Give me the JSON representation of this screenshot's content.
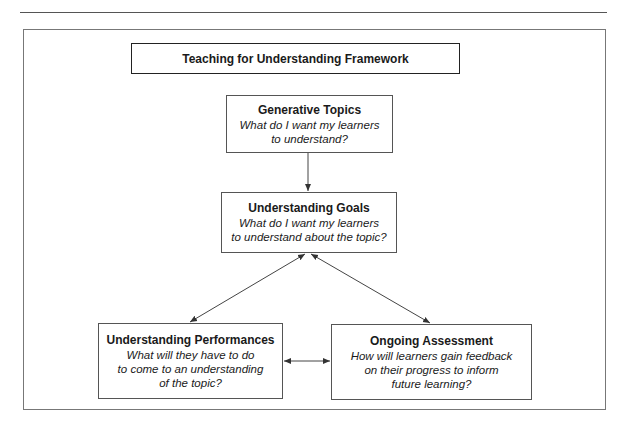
{
  "diagram": {
    "title": "Teaching for Understanding Framework",
    "nodes": [
      {
        "id": "topics",
        "head": "Generative Topics",
        "question": "What do I want my learners\nto understand?"
      },
      {
        "id": "goals",
        "head": "Understanding Goals",
        "question": "What do I want my learners\nto understand about the topic?"
      },
      {
        "id": "performances",
        "head": "Understanding Performances",
        "question": "What will they have to do\nto come to an understanding\nof the topic?"
      },
      {
        "id": "assessment",
        "head": "Ongoing Assessment",
        "question": "How will learners gain feedback\non their progress to inform\nfuture learning?"
      }
    ],
    "edges": [
      {
        "from": "topics",
        "to": "goals",
        "type": "arrow"
      },
      {
        "from": "goals",
        "to": "performances",
        "type": "bidirectional"
      },
      {
        "from": "goals",
        "to": "assessment",
        "type": "bidirectional"
      },
      {
        "from": "performances",
        "to": "assessment",
        "type": "bidirectional"
      }
    ],
    "colors": {
      "line": "#444444",
      "border": "#555555",
      "background": "#ffffff"
    }
  }
}
